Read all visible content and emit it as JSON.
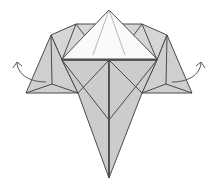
{
  "diagram": {
    "title": "Origami fold step",
    "colors": {
      "paper_gray": "#cfcfcf",
      "paper_gray_dark": "#bdbdbd",
      "paper_white": "#fafafa",
      "line": "#4a4a4a",
      "arrow": "#555555",
      "background": "#ffffff"
    },
    "arrows": [
      {
        "id": "left",
        "direction": "outward-left"
      },
      {
        "id": "right",
        "direction": "outward-right"
      }
    ]
  }
}
